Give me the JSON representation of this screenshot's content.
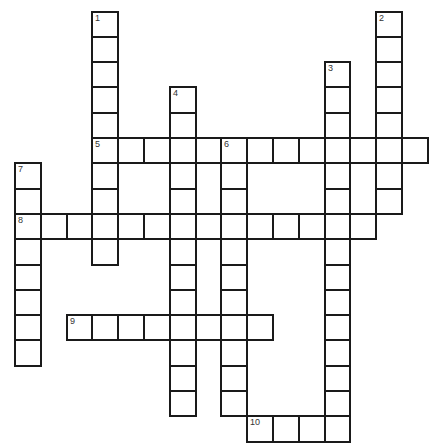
{
  "puzzle": {
    "header_text": "",
    "grid": {
      "origin_x": 15,
      "origin_y": 11.5,
      "cell_w": 25.8,
      "cell_h": 25.3
    },
    "entries": [
      {
        "number": "1",
        "direction": "down",
        "row": 0,
        "col": 3,
        "length": 10
      },
      {
        "number": "2",
        "direction": "down",
        "row": 0,
        "col": 14,
        "length": 8
      },
      {
        "number": "3",
        "direction": "down",
        "row": 2,
        "col": 12,
        "length": 15
      },
      {
        "number": "4",
        "direction": "down",
        "row": 3,
        "col": 6,
        "length": 13
      },
      {
        "number": "5",
        "direction": "across",
        "row": 5,
        "col": 3,
        "length": 13
      },
      {
        "number": "6",
        "direction": "down",
        "row": 5,
        "col": 8,
        "length": 11
      },
      {
        "number": "7",
        "direction": "down",
        "row": 6,
        "col": 0,
        "length": 8
      },
      {
        "number": "8",
        "direction": "across",
        "row": 8,
        "col": 0,
        "length": 14
      },
      {
        "number": "9",
        "direction": "across",
        "row": 12,
        "col": 2,
        "length": 8
      },
      {
        "number": "10",
        "direction": "across",
        "row": 16,
        "col": 9,
        "length": 4
      }
    ]
  }
}
